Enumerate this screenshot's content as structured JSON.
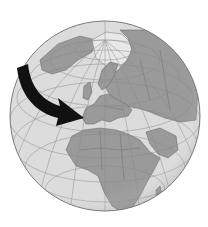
{
  "illustration": {
    "subject": "Globe centered on Europe and Africa with a curved arrow pointing to Western Europe",
    "caption": "",
    "colors": {
      "background": "#ffffff",
      "ocean": "#dcdcdc",
      "land": "#9a9a9a",
      "ice": "#e4e4e4",
      "borders": "#6e6e6e",
      "graticule": "#8a8a8a",
      "rim": "#7a7a7a",
      "arrow": "#111111"
    },
    "globe": {
      "cx": 105,
      "cy": 116,
      "r": 95
    },
    "arrow": {
      "direction": "from North Atlantic curving southeast toward Iberia / Western Europe"
    }
  }
}
